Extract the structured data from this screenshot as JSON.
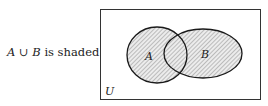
{
  "caption": {
    "set_a": "A",
    "union_symbol": "∪",
    "set_b": "B",
    "text": "is shaded"
  },
  "diagram": {
    "universe_label": "U",
    "set_a_label": "A",
    "set_b_label": "B",
    "shaded_region": "A ∪ B",
    "colors": {
      "stroke": "#1a1a1a",
      "hatch": "#8a8a8a",
      "fill": "#e6e6e6"
    }
  }
}
